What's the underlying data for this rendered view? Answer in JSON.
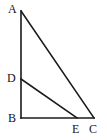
{
  "figure": {
    "kind": "geometry-diagram",
    "background_color": "#ffffff",
    "stroke_color": "#1a1a1a",
    "label_color": "#141414",
    "stroke_width": 1.6,
    "points": [
      {
        "id": "A",
        "label": "A",
        "x": 21,
        "y": 11,
        "label_x": 8,
        "label_y": 3
      },
      {
        "id": "D",
        "label": "D",
        "x": 21,
        "y": 79,
        "label_x": 7,
        "label_y": 72
      },
      {
        "id": "B",
        "label": "B",
        "x": 21,
        "y": 118,
        "label_x": 8,
        "label_y": 112
      },
      {
        "id": "E",
        "label": "E",
        "x": 77,
        "y": 118,
        "label_x": 72,
        "label_y": 123
      },
      {
        "id": "C",
        "label": "C",
        "x": 94,
        "y": 118,
        "label_x": 89,
        "label_y": 123
      }
    ],
    "segments": [
      {
        "id": "AB",
        "from": "A",
        "to": "B",
        "x1": 21,
        "y1": 11,
        "x2": 21,
        "y2": 118
      },
      {
        "id": "BC",
        "from": "B",
        "to": "C",
        "x1": 21,
        "y1": 118,
        "x2": 94,
        "y2": 118
      },
      {
        "id": "AC",
        "from": "A",
        "to": "C",
        "x1": 21,
        "y1": 11,
        "x2": 94,
        "y2": 118
      },
      {
        "id": "DE",
        "from": "D",
        "to": "E",
        "x1": 21,
        "y1": 79,
        "x2": 77,
        "y2": 118
      }
    ]
  }
}
